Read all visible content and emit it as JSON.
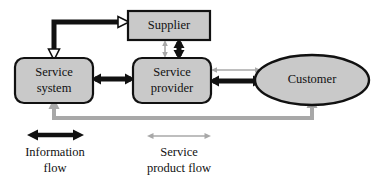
{
  "diagram": {
    "colors": {
      "node_fill": "#c9c9c9",
      "node_stroke": "#111111",
      "information_flow": "#111111",
      "service_product_flow": "#a8a8a8",
      "background": "#ffffff",
      "text": "#111111"
    },
    "nodes": [
      {
        "id": "supplier",
        "label": "Supplier",
        "shape": "rectangle",
        "x": 128,
        "y": 11,
        "width": 82,
        "height": 29
      },
      {
        "id": "service-system",
        "label_line1": "Service",
        "label_line2": "system",
        "shape": "rounded-rectangle",
        "x": 15,
        "y": 58,
        "width": 78,
        "height": 45
      },
      {
        "id": "service-provider",
        "label_line1": "Service",
        "label_line2": "provider",
        "shape": "rounded-rectangle",
        "x": 133,
        "y": 58,
        "width": 78,
        "height": 45
      },
      {
        "id": "customer",
        "label": "Customer",
        "shape": "ellipse",
        "cx": 312,
        "cy": 80,
        "rx": 57,
        "ry": 25
      }
    ],
    "connections": [
      {
        "id": "system-to-supplier",
        "from": "service-system",
        "to": "supplier",
        "flow": "information",
        "style": "elbow-double-arrow"
      },
      {
        "id": "supplier-to-provider-information",
        "from": "supplier",
        "to": "service-provider",
        "flow": "information",
        "style": "vertical-double-arrow"
      },
      {
        "id": "supplier-to-provider-product",
        "from": "supplier",
        "to": "service-provider",
        "flow": "service-product",
        "style": "vertical-double-arrow"
      },
      {
        "id": "system-to-provider",
        "from": "service-system",
        "to": "service-provider",
        "flow": "information",
        "style": "horizontal-double-arrow"
      },
      {
        "id": "provider-to-customer-information",
        "from": "service-provider",
        "to": "customer",
        "flow": "information",
        "style": "horizontal-double-arrow"
      },
      {
        "id": "provider-to-customer-product",
        "from": "service-provider",
        "to": "customer",
        "flow": "service-product",
        "style": "horizontal-double-arrow"
      },
      {
        "id": "customer-to-system-product",
        "from": "customer",
        "to": "service-system",
        "flow": "service-product",
        "style": "elbow-double-arrow-up"
      }
    ],
    "legend": [
      {
        "id": "information-flow",
        "label_line1": "Information",
        "label_line2": "flow",
        "color": "#111111",
        "arrow": "double-arrow-thick",
        "arrow_x1": 28,
        "arrow_x2": 83,
        "arrow_y": 135,
        "text_x": 55,
        "text_y1": 152,
        "text_y2": 168
      },
      {
        "id": "service-product-flow",
        "label_line1": "Service",
        "label_line2": "product flow",
        "color": "#a8a8a8",
        "arrow": "double-arrow-thin",
        "arrow_x1": 148,
        "arrow_x2": 210,
        "arrow_y": 136,
        "text_x": 179,
        "text_y1": 152,
        "text_y2": 168
      }
    ]
  }
}
